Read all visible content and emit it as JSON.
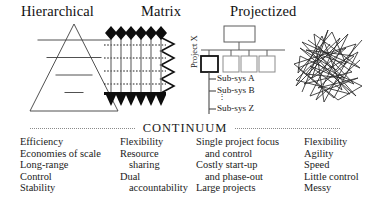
{
  "titles": [
    {
      "label": "Hierarchical"
    },
    {
      "label": "Matrix"
    },
    {
      "label": "Projectized"
    }
  ],
  "diagrams": {
    "pyramid": {
      "name": "pyramid-diagram",
      "levels": 5
    },
    "matrix": {
      "name": "matrix-grid-diagram",
      "vertical_arrows": 6,
      "dotted_rows": 4
    },
    "projectized": {
      "name": "org-chart-diagram",
      "vertical_axis_label": "Project X",
      "subsystems": [
        "Sub-sys A",
        "Sub-sys B",
        "Sub-sys Z"
      ],
      "ellipsis": "⋮",
      "boxes": 4,
      "highlighted_box_index": 0
    },
    "scribble": {
      "name": "network-scribble-diagram"
    }
  },
  "continuum": {
    "label": "CONTINUUM"
  },
  "attributes": {
    "columns": [
      {
        "lines": [
          {
            "text": "Efficiency",
            "indent": false
          },
          {
            "text": "Economies of scale",
            "indent": false
          },
          {
            "text": "Long-range",
            "indent": false
          },
          {
            "text": "Control",
            "indent": false
          },
          {
            "text": "Stability",
            "indent": false
          }
        ]
      },
      {
        "lines": [
          {
            "text": "Flexibility",
            "indent": false
          },
          {
            "text": "Resource",
            "indent": false
          },
          {
            "text": "sharing",
            "indent": true
          },
          {
            "text": "Dual",
            "indent": false
          },
          {
            "text": "accountability",
            "indent": true
          }
        ]
      },
      {
        "lines": [
          {
            "text": "Single project focus",
            "indent": false
          },
          {
            "text": "and control",
            "indent": true
          },
          {
            "text": "Costly start-up",
            "indent": false
          },
          {
            "text": "and phase-out",
            "indent": true
          },
          {
            "text": "Large projects",
            "indent": false
          }
        ]
      },
      {
        "lines": [
          {
            "text": "Flexibility",
            "indent": false
          },
          {
            "text": "Agility",
            "indent": false
          },
          {
            "text": "Speed",
            "indent": false
          },
          {
            "text": "Little control",
            "indent": false
          },
          {
            "text": "Messy",
            "indent": false
          }
        ]
      }
    ]
  },
  "colors": {
    "ink": "#1a1a1a",
    "line": "#4a4a4a",
    "rule": "#8a8a8a"
  }
}
